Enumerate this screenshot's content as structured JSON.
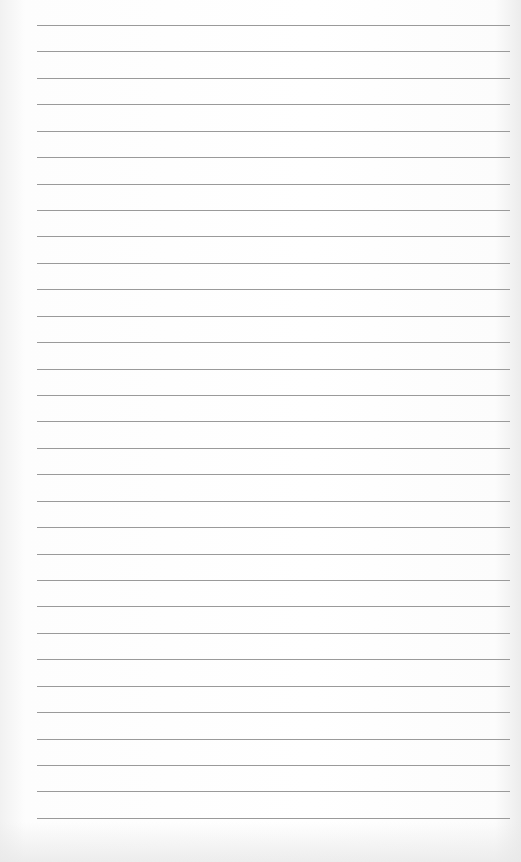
{
  "paper": {
    "type": "lined-notebook-page",
    "line_count": 31,
    "first_line_y": 25,
    "line_spacing": 26.43,
    "line_left": 37,
    "line_right": 510,
    "line_color": "#9a9a9a",
    "background_color": "#ffffff"
  }
}
